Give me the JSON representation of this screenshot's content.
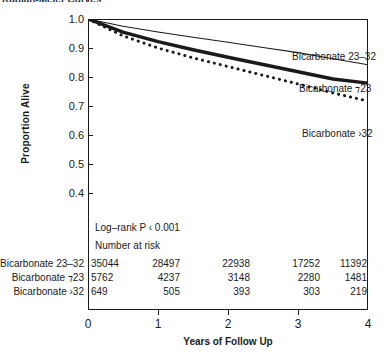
{
  "title": "Kaplan-Meier Curves",
  "chart_data": {
    "type": "line",
    "title": "Kaplan-Meier Curves",
    "xlabel": "Years of Follow Up",
    "ylabel": "Proportion Alive",
    "xlim": [
      0,
      4
    ],
    "ylim": [
      0.35,
      1.0
    ],
    "xticks": [
      "0",
      "1",
      "2",
      "3",
      "4"
    ],
    "yticks": [
      "1.0",
      "0.9",
      "0.8",
      "0.7",
      "0.6",
      "0.5",
      "0.4"
    ],
    "grid": false,
    "legend_position": "inline-right",
    "annotation": "Log–rank P ‹ 0.001",
    "series": [
      {
        "name": "Bicarbonate 23–32",
        "style": "thin-solid",
        "x": [
          0,
          0.5,
          1,
          1.5,
          2,
          2.5,
          3,
          3.5,
          4
        ],
        "values": [
          1.0,
          0.975,
          0.955,
          0.937,
          0.92,
          0.902,
          0.884,
          0.863,
          0.842
        ]
      },
      {
        "name": "Bicarbonate ⁊23",
        "style": "thick-solid",
        "x": [
          0,
          0.5,
          1,
          1.5,
          2,
          2.5,
          3,
          3.5,
          4
        ],
        "values": [
          1.0,
          0.955,
          0.922,
          0.894,
          0.868,
          0.843,
          0.818,
          0.793,
          0.779
        ]
      },
      {
        "name": "Bicarbonate ›32",
        "style": "dotted",
        "x": [
          0,
          0.5,
          1,
          1.5,
          2,
          2.5,
          3,
          3.5,
          4
        ],
        "values": [
          1.0,
          0.942,
          0.9,
          0.866,
          0.836,
          0.806,
          0.776,
          0.745,
          0.717
        ]
      }
    ],
    "number_at_risk": {
      "title": "Number at risk",
      "columns": [
        "0",
        "1",
        "2",
        "3",
        "4"
      ],
      "rows": [
        {
          "label": "Bicarbonate 23–32",
          "values": [
            "35044",
            "28497",
            "22938",
            "17252",
            "11392"
          ]
        },
        {
          "label": "Bicarbonate ⁊23",
          "values": [
            "5762",
            "4237",
            "3148",
            "2280",
            "1481"
          ]
        },
        {
          "label": "Bicarbonate ›32",
          "values": [
            "649",
            "505",
            "393",
            "303",
            "219"
          ]
        }
      ]
    }
  },
  "colors": {
    "ink": "#1a1a1a",
    "background": "#ffffff"
  }
}
